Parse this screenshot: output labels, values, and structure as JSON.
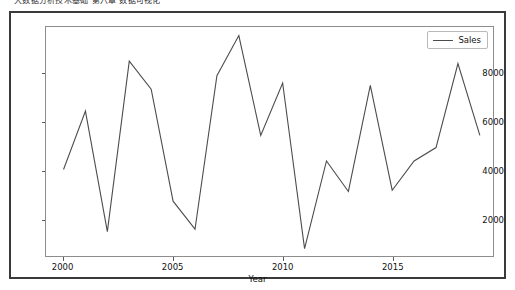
{
  "top_caption": "大数据分析技术基础 第六章 数据可视化",
  "figure": {
    "legend": {
      "entries": [
        {
          "label": "Sales",
          "color": "#4c4c4c",
          "marker": "line"
        }
      ],
      "position": "upper right"
    }
  },
  "chart_data": {
    "type": "line",
    "title": "",
    "xlabel": "Year",
    "ylabel": "",
    "grid": false,
    "legend_position": "upper right",
    "xlim": [
      1999.2,
      2019.6
    ],
    "ylim": [
      500,
      9900
    ],
    "xticks": [
      2000,
      2005,
      2010,
      2015
    ],
    "xtick_labels": [
      "2000",
      "2005",
      "2010",
      "2015"
    ],
    "yticks": [
      2000,
      4000,
      6000,
      8000
    ],
    "ytick_labels": [
      "2000",
      "4000",
      "6000",
      "8000"
    ],
    "x": [
      2000,
      2001,
      2002,
      2003,
      2004,
      2005,
      2006,
      2007,
      2008,
      2009,
      2010,
      2011,
      2012,
      2013,
      2014,
      2015,
      2016,
      2017,
      2018,
      2019
    ],
    "series": [
      {
        "name": "Sales",
        "color": "#4c4c4c",
        "values": [
          4050,
          6450,
          1500,
          8500,
          7350,
          2750,
          1600,
          7900,
          9550,
          5450,
          7600,
          800,
          4400,
          3150,
          7500,
          3200,
          4400,
          4950,
          8400,
          5450
        ]
      }
    ]
  }
}
